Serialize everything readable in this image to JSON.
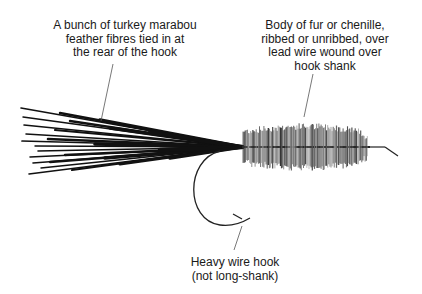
{
  "diagram": {
    "labels": {
      "tail": {
        "lines": [
          "A bunch of turkey marabou",
          "feather fibres tied in at",
          "the rear of the hook"
        ]
      },
      "body": {
        "lines": [
          "Body of fur or chenille,",
          "ribbed or unribbed, over",
          "lead wire wound over",
          "hook shank"
        ]
      },
      "hook": {
        "lines": [
          "Heavy wire hook",
          "(not long-shank)"
        ]
      }
    },
    "colors": {
      "background": "#ffffff",
      "ink": "#111111",
      "leader": "#555555",
      "body_fibre": "#6a6a6a"
    }
  }
}
